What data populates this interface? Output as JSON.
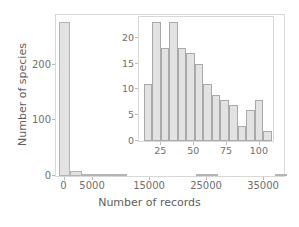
{
  "chart_data": [
    {
      "id": "main",
      "type": "bar",
      "title": "",
      "xlabel": "Number of records",
      "ylabel": "Number of species",
      "xlim": [
        -1500,
        38500
      ],
      "ylim": [
        0,
        290
      ],
      "xticks": [
        0,
        5000,
        15000,
        25000,
        35000
      ],
      "xtick_labels": [
        "0",
        "5000",
        "15000",
        "25000",
        "35000"
      ],
      "yticks": [
        0,
        100,
        200
      ],
      "ytick_labels": [
        "0",
        "100",
        "200"
      ],
      "grid": false,
      "bin_width": 2000,
      "bin_starts": [
        -1000,
        1000,
        3000,
        5000,
        7000,
        9000,
        11000,
        13000,
        15000,
        17000,
        19000,
        21000,
        23000,
        25000,
        27000,
        29000,
        31000,
        33000,
        35000,
        37000
      ],
      "values": [
        278,
        9,
        2,
        2,
        1,
        1,
        0,
        0,
        0,
        0,
        0,
        0,
        1,
        1,
        0,
        0,
        0,
        0,
        0,
        1
      ],
      "bar_fill": "#e2e2e2",
      "bar_edge": "#b4b4b4"
    },
    {
      "id": "inset",
      "type": "bar",
      "title": "",
      "xlabel": "",
      "ylabel": "",
      "xlim": [
        8,
        110
      ],
      "ylim": [
        0,
        24
      ],
      "xticks": [
        25,
        50,
        75,
        100
      ],
      "xtick_labels": [
        "25",
        "50",
        "75",
        "100"
      ],
      "yticks": [
        0,
        5,
        10,
        15,
        20
      ],
      "ytick_labels": [
        "0",
        "5",
        "10",
        "15",
        "20"
      ],
      "grid": false,
      "bin_width": 6.5,
      "bin_starts": [
        11.5,
        18.0,
        24.5,
        31.0,
        37.5,
        44.0,
        50.5,
        57.0,
        63.5,
        70.0,
        76.5,
        83.0,
        89.5,
        96.0,
        102.5
      ],
      "values": [
        11,
        23,
        18,
        23,
        18,
        17,
        15,
        11,
        9,
        8,
        7,
        3,
        6,
        8,
        2
      ],
      "bar_fill": "#e2e2e2",
      "bar_edge": "#a9a9a9"
    }
  ],
  "figure": {
    "background": "#ffffff",
    "axis_color": "#d8d8d8",
    "text_color": "#6f6f6f"
  },
  "main": {
    "xlabel": "Number of records",
    "ylabel": "Number of species"
  }
}
